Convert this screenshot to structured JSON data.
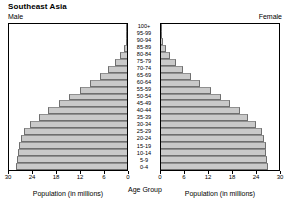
{
  "title": "Southeast Asia",
  "male_label": "Male",
  "female_label": "Female",
  "center_axis_title": "Age Group",
  "left_axis_title": "Population (in millions)",
  "right_axis_title": "Population (in millions)",
  "colors": {
    "bar_fill": "#c9c9c9",
    "bar_edge": "#6f6f6f",
    "frame": "#000000",
    "background": "#ffffff"
  },
  "chart_data": {
    "type": "bar",
    "subtype": "population-pyramid",
    "title": "Southeast Asia",
    "xlabel": "Population (in millions)",
    "ylabel": "Age Group",
    "xlim": [
      0,
      30
    ],
    "xticks": [
      0,
      6,
      12,
      18,
      24,
      30
    ],
    "left_xticks": [
      30,
      24,
      18,
      12,
      6,
      0
    ],
    "right_xticks": [
      0,
      6,
      12,
      18,
      24,
      30
    ],
    "grid": false,
    "legend": "none",
    "categories": [
      "0-4",
      "5-9",
      "10-14",
      "15-19",
      "20-24",
      "25-29",
      "30-34",
      "35-39",
      "40-44",
      "45-49",
      "50-54",
      "55-59",
      "60-64",
      "65-69",
      "70-74",
      "75-79",
      "80-84",
      "85-89",
      "90-94",
      "95-99",
      "100+"
    ],
    "series": [
      {
        "name": "Male",
        "side": "left",
        "values": [
          28.2,
          28.0,
          27.8,
          27.4,
          27.0,
          26.2,
          24.6,
          22.4,
          20.0,
          17.4,
          14.8,
          12.0,
          9.3,
          6.8,
          4.8,
          3.0,
          1.7,
          0.8,
          0.3,
          0.1,
          0.05
        ]
      },
      {
        "name": "Female",
        "side": "right",
        "values": [
          27.2,
          27.0,
          26.8,
          26.6,
          26.3,
          25.6,
          24.2,
          22.2,
          20.0,
          17.6,
          15.2,
          12.6,
          10.0,
          7.6,
          5.6,
          3.8,
          2.3,
          1.2,
          0.5,
          0.15,
          0.06
        ]
      }
    ]
  }
}
